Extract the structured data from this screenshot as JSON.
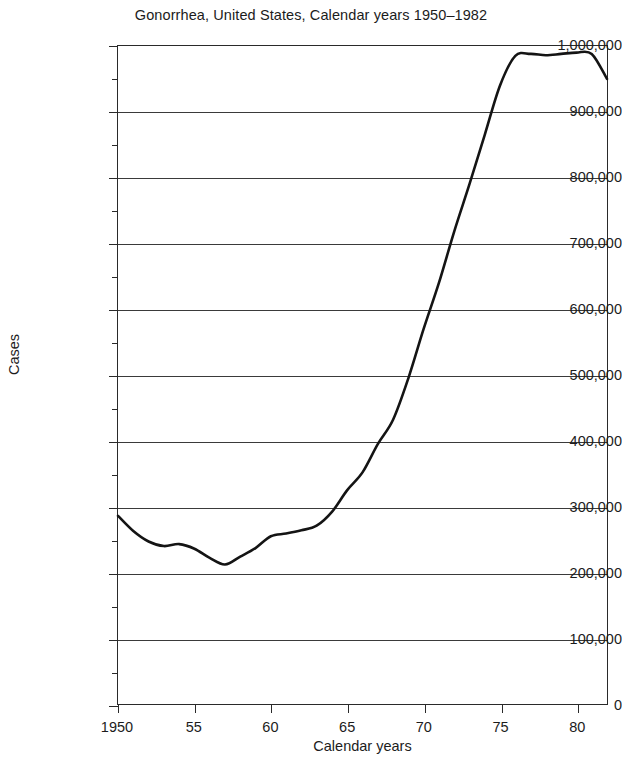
{
  "chart_data": {
    "type": "line",
    "title": "Gonorrhea, United States, Calendar years 1950–1982",
    "xlabel": "Calendar years",
    "ylabel": "Cases",
    "xlim": [
      1950,
      1982
    ],
    "ylim": [
      0,
      1000000
    ],
    "grid": true,
    "legend": null,
    "x_tick_labels": [
      "1950",
      "55",
      "60",
      "65",
      "70",
      "75",
      "80"
    ],
    "x_tick_values": [
      1950,
      1955,
      1960,
      1965,
      1970,
      1975,
      1980
    ],
    "y_tick_labels": [
      "0",
      "100,000",
      "200,000",
      "300,000",
      "400,000",
      "500,000",
      "600,000",
      "700,000",
      "800,000",
      "900,000",
      "1,000,000"
    ],
    "y_tick_values": [
      0,
      100000,
      200000,
      300000,
      400000,
      500000,
      600000,
      700000,
      800000,
      900000,
      1000000
    ],
    "y_minor_tick_interval": 50000,
    "line_color": "#141414",
    "series": [
      {
        "name": "Gonorrhea cases",
        "x": [
          1950,
          1951,
          1952,
          1953,
          1954,
          1955,
          1956,
          1957,
          1958,
          1959,
          1960,
          1961,
          1962,
          1963,
          1964,
          1965,
          1966,
          1967,
          1968,
          1969,
          1970,
          1971,
          1972,
          1973,
          1974,
          1975,
          1976,
          1977,
          1978,
          1979,
          1980,
          1981,
          1982
        ],
        "values": [
          286000,
          263000,
          247000,
          240000,
          243000,
          236000,
          222000,
          212000,
          224000,
          237000,
          255000,
          259000,
          264000,
          271000,
          292000,
          325000,
          352000,
          395000,
          432000,
          495000,
          570000,
          640000,
          718000,
          790000,
          865000,
          940000,
          985000,
          988000,
          986000,
          988000,
          990000,
          988000,
          950000
        ]
      }
    ]
  },
  "axis": {
    "y_title": "Cases",
    "x_title": "Calendar years"
  }
}
